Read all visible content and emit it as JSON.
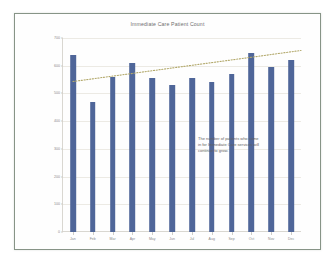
{
  "chart_data": {
    "type": "bar",
    "title": "Immediate Care Patient Count",
    "xlabel": "",
    "ylabel": "",
    "categories": [
      "Jan",
      "Feb",
      "Mar",
      "Apr",
      "May",
      "Jun",
      "Jul",
      "Aug",
      "Sep",
      "Oct",
      "Nov",
      "Dec"
    ],
    "values": [
      640,
      470,
      560,
      610,
      555,
      530,
      557,
      540,
      570,
      645,
      595,
      620
    ],
    "ylim": [
      0,
      700
    ],
    "yticks": [
      0,
      100,
      200,
      300,
      400,
      500,
      600,
      700
    ],
    "ytick_labels": [
      "0",
      "100",
      "200",
      "300",
      "400",
      "500",
      "600",
      "700"
    ],
    "grid": true,
    "legend": "none",
    "series": [
      {
        "name": "Patient Count",
        "type": "bar",
        "color": "#4f6699",
        "values": [
          640,
          470,
          560,
          610,
          555,
          530,
          557,
          540,
          570,
          645,
          595,
          620
        ]
      },
      {
        "name": "Trendline",
        "type": "line",
        "style": "dotted",
        "color": "#b2a86a",
        "start_value": 543,
        "end_value": 655,
        "extends_past_last_bar": true
      }
    ],
    "annotations": [
      {
        "name": "growth-note",
        "lines": [
          "The number of patients who come",
          "in for Immediate Care services will",
          "continue to grow."
        ]
      }
    ]
  },
  "slide": {
    "border_color": "#879487",
    "background": "#fefefe"
  }
}
